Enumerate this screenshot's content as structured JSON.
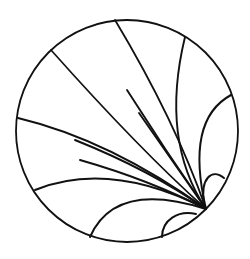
{
  "diagram": {
    "title": "",
    "type": "poincare-disk-geodesics",
    "width": 250,
    "height": 259,
    "stroke_color": "#111111",
    "background": "#ffffff",
    "disk": {
      "cx": 127,
      "cy": 131,
      "r": 111,
      "stroke_width": 1.8
    },
    "ideal_point": {
      "x": 206,
      "y": 209
    },
    "geodesics": [
      {
        "id": "g1",
        "from": [
          51,
          50
        ],
        "c": [
          140,
          150
        ],
        "stroke_width": 1.7
      },
      {
        "id": "g2",
        "from": [
          115,
          20
        ],
        "c": [
          175,
          120
        ],
        "stroke_width": 1.8
      },
      {
        "id": "g3",
        "from": [
          185,
          37
        ],
        "c": [
          160,
          140
        ],
        "stroke_width": 1.9
      },
      {
        "id": "g4",
        "from": [
          231,
          95
        ],
        "c": [
          185,
          120
        ],
        "stroke_width": 2.0
      },
      {
        "id": "g5",
        "from": [
          18,
          118
        ],
        "c": [
          110,
          140
        ],
        "stroke_width": 1.9
      },
      {
        "id": "g6",
        "from": [
          35,
          190
        ],
        "c": [
          110,
          160
        ],
        "stroke_width": 2.0
      },
      {
        "id": "g7",
        "from": [
          90,
          237
        ],
        "c": [
          115,
          180
        ],
        "stroke_width": 2.0
      },
      {
        "id": "g8",
        "from": [
          139,
          113
        ],
        "c": [
          172,
          160
        ],
        "stroke_width": 1.9
      },
      {
        "id": "g9",
        "from": [
          127,
          90
        ],
        "c": [
          165,
          150
        ],
        "stroke_width": 1.9
      },
      {
        "id": "g10",
        "from": [
          80,
          160
        ],
        "c": [
          150,
          180
        ],
        "stroke_width": 1.9
      },
      {
        "id": "g11",
        "from": [
          75,
          140
        ],
        "c": [
          150,
          170
        ],
        "stroke_width": 1.9
      }
    ],
    "small_arcs": [
      {
        "id": "a1",
        "d": "M 162 237 C 162 220, 178 210, 196 214",
        "stroke_width": 2.0
      },
      {
        "id": "a2",
        "d": "M 224 178 C 212 168, 200 178, 204 204",
        "stroke_width": 2.0
      }
    ]
  }
}
